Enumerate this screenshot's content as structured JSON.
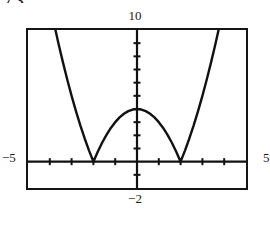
{
  "header": {
    "clipped_text": "7 3."
  },
  "labels": {
    "y_max": "10",
    "y_min": "−2",
    "x_min": "−5",
    "x_max": "5"
  },
  "colors": {
    "frame": "#151515",
    "axis": "#111111",
    "curve": "#111111",
    "background": "#ffffff"
  },
  "chart_data": {
    "type": "line",
    "title": "",
    "xlabel": "",
    "ylabel": "",
    "xlim": [
      -5,
      5
    ],
    "ylim": [
      -2,
      10
    ],
    "grid": false,
    "legend": null,
    "axis_ticks": {
      "x": [
        -4,
        -3,
        -2,
        -1,
        1,
        2,
        3,
        4
      ],
      "y": [
        -1,
        1,
        2,
        3,
        4,
        5,
        6,
        7,
        8,
        9
      ],
      "x_tick_step": 1,
      "y_tick_step": 1
    },
    "roots": [
      -2,
      2
    ],
    "local_max": {
      "x": 0,
      "y": 4
    },
    "series": [
      {
        "name": "y = |4 - x^2|",
        "x": [
          -5.0,
          -4.8,
          -4.6,
          -4.4,
          -4.2,
          -4.0,
          -3.8,
          -3.6,
          -3.4,
          -3.2,
          -3.0,
          -2.8,
          -2.6,
          -2.4,
          -2.2,
          -2.0,
          -1.8,
          -1.6,
          -1.4,
          -1.2,
          -1.0,
          -0.8,
          -0.6,
          -0.4,
          -0.2,
          0.0,
          0.2,
          0.4,
          0.6,
          0.8,
          1.0,
          1.2,
          1.4,
          1.6,
          1.8,
          2.0,
          2.2,
          2.4,
          2.6,
          2.8,
          3.0,
          3.2,
          3.4,
          3.6,
          3.8,
          4.0,
          4.2,
          4.4,
          4.6,
          4.8,
          5.0
        ],
        "y": [
          21.0,
          19.04,
          17.16,
          15.36,
          13.64,
          12.0,
          10.44,
          8.96,
          7.56,
          6.24,
          5.0,
          3.84,
          2.76,
          1.76,
          0.84,
          0.0,
          0.76,
          1.44,
          2.04,
          2.56,
          3.0,
          3.36,
          3.64,
          3.84,
          3.96,
          4.0,
          3.96,
          3.84,
          3.64,
          3.36,
          3.0,
          2.56,
          2.04,
          1.44,
          0.76,
          0.0,
          0.84,
          1.76,
          2.76,
          3.84,
          5.0,
          6.24,
          7.56,
          8.96,
          10.44,
          12.0,
          13.64,
          15.36,
          17.16,
          19.04,
          21.0
        ]
      }
    ]
  }
}
